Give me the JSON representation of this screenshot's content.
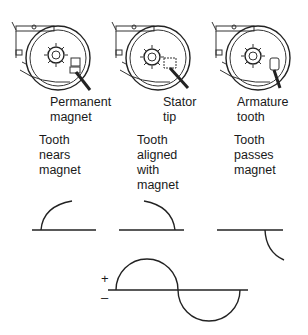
{
  "panels": [
    {
      "callout": [
        "Permanent",
        "magnet"
      ],
      "stage": [
        "Tooth",
        "nears",
        "magnet"
      ],
      "waveform": "rising-quarter"
    },
    {
      "callout": [
        "Stator",
        "tip"
      ],
      "stage": [
        "Tooth",
        "aligned",
        "with",
        "magnet"
      ],
      "waveform": "falling-quarter"
    },
    {
      "callout": [
        "Armature",
        "tooth"
      ],
      "stage": [
        "Tooth",
        "passes",
        "magnet"
      ],
      "waveform": "negative-quarter"
    }
  ],
  "output_signal": {
    "description": "Full AC sine wave cycle",
    "plus_label": "+",
    "minus_label": "–"
  },
  "colors": {
    "line": "#222222",
    "background": "#ffffff"
  }
}
